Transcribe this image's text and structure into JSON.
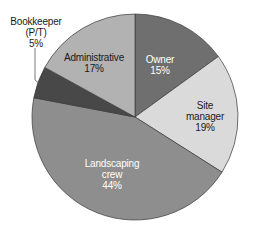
{
  "chart_data": {
    "type": "pie",
    "title": "",
    "start_angle_deg": 0,
    "direction": "clockwise",
    "slices": [
      {
        "label": "Owner",
        "value": 15,
        "value_label": "15%",
        "color": "#6f6f6f",
        "text_color": "#ffffff"
      },
      {
        "label": "Site manager",
        "value": 19,
        "value_label": "19%",
        "color": "#dadada",
        "text_color": "#1a1a1a"
      },
      {
        "label": "Landscaping crew",
        "value": 44,
        "value_label": "44%",
        "color": "#8e8e8e",
        "text_color": "#ffffff"
      },
      {
        "label": "Bookkeeper (P/T)",
        "value": 5,
        "value_label": "5%",
        "color": "#484848",
        "text_color": "#1a1a1a"
      },
      {
        "label": "Administrative",
        "value": 17,
        "value_label": "17%",
        "color": "#b2b2b2",
        "text_color": "#1a1a1a"
      }
    ],
    "legend": "none",
    "labels_position": "inside (Bookkeeper outside with leader line)"
  },
  "labels": {
    "owner": {
      "line1": "Owner",
      "line2": "15%"
    },
    "site_manager": {
      "line1": "Site",
      "line2": "manager",
      "line3": "19%"
    },
    "landscaping": {
      "line1": "Landscaping",
      "line2": "crew",
      "line3": "44%"
    },
    "bookkeeper": {
      "line1": "Bookkeeper",
      "line2": "(P/T)",
      "line3": "5%"
    },
    "administrative": {
      "line1": "Administrative",
      "line2": "17%"
    }
  }
}
